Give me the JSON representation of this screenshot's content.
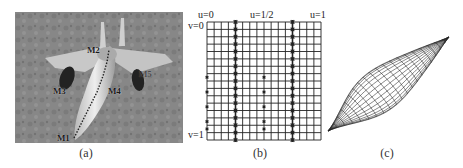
{
  "figure": {
    "panels": [
      {
        "id": "a",
        "caption": "(a)",
        "description": "Grayscale photo of a fighter jet with marked path along fuselage",
        "markers": [
          {
            "label": "M1",
            "x": 58,
            "y": 129
          },
          {
            "label": "M2",
            "x": 86,
            "y": 41
          },
          {
            "label": "M3",
            "x": 50,
            "y": 83
          },
          {
            "label": "M4",
            "x": 102,
            "y": 83
          },
          {
            "label": "M5",
            "x": 132,
            "y": 67
          }
        ]
      },
      {
        "id": "b",
        "caption": "(b)",
        "description": "Parametric u-v grid with starred columns",
        "labels": {
          "u0": "u=0",
          "u_half": "u=1/2",
          "u1": "u=1",
          "v0": "v=0",
          "v1": "v=1"
        },
        "grid": {
          "columns": 16,
          "rows": 16
        },
        "starred_columns": [
          4,
          12
        ],
        "edge_markers_rows": [
          8,
          10,
          12,
          14,
          15
        ]
      },
      {
        "id": "c",
        "caption": "(c)",
        "description": "3D wireframe spindle-shaped surface"
      }
    ]
  }
}
